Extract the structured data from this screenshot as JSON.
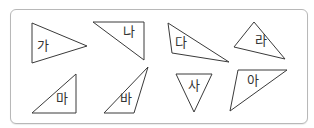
{
  "diagram": {
    "stroke_color": "#3a3a3a",
    "frame_border_color": "#b8b8b8",
    "triangles": [
      {
        "label": "가",
        "points": "32,23 87,46 32,63",
        "label_x": 43,
        "label_y": 45
      },
      {
        "label": "나",
        "points": "93,22 144,22 144,60",
        "label_x": 129,
        "label_y": 31
      },
      {
        "label": "다",
        "points": "168,23 229,62 172,53",
        "label_x": 181,
        "label_y": 42
      },
      {
        "label": "라",
        "points": "254,22 285,59 234,47",
        "label_x": 261,
        "label_y": 40
      },
      {
        "label": "마",
        "points": "76,74 76,113 32,113",
        "label_x": 62,
        "label_y": 98
      },
      {
        "label": "바",
        "points": "148,67 134,113 104,113",
        "label_x": 126,
        "label_y": 98
      },
      {
        "label": "사",
        "points": "176,74 212,74 194,112",
        "label_x": 194,
        "label_y": 85
      },
      {
        "label": "아",
        "points": "238,70 287,70 230,111",
        "label_x": 253,
        "label_y": 80
      }
    ]
  }
}
